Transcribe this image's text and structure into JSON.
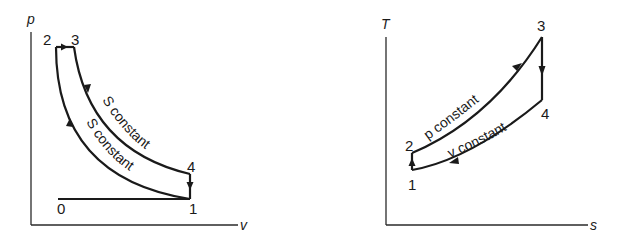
{
  "pv_diagram": {
    "axes": {
      "y_label": "p",
      "x_label": "v"
    },
    "points": {
      "p0": "0",
      "p1": "1",
      "p2": "2",
      "p3": "3",
      "p4": "4"
    },
    "curves": {
      "upper": "S constant",
      "lower": "S constant"
    }
  },
  "ts_diagram": {
    "axes": {
      "y_label": "T",
      "x_label": "s"
    },
    "points": {
      "p1": "1",
      "p2": "2",
      "p3": "3",
      "p4": "4"
    },
    "curves": {
      "upper": "p constant",
      "lower": "v constant"
    }
  }
}
